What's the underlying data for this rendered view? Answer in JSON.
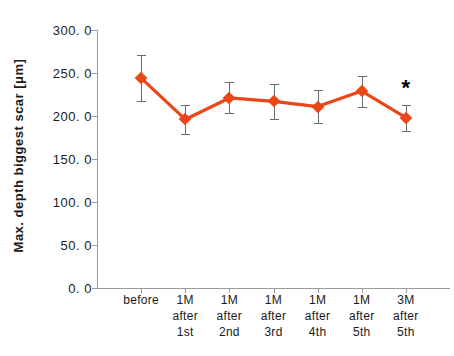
{
  "chart_data": {
    "type": "line",
    "title": "",
    "subtitle": "",
    "xlabel": "",
    "ylabel": "Max. depth biggest  scar [μm]",
    "ylim": [
      0.0,
      300.0
    ],
    "ytick_values": [
      300.0,
      250.0,
      200.0,
      150.0,
      100.0,
      50.0,
      0.0
    ],
    "ytick_labels": [
      "300. 0",
      "250. 0",
      "200. 0",
      "150. 0",
      "100. 0",
      "50. 0",
      "0. 0"
    ],
    "grid": false,
    "legend": "none",
    "categories": [
      "before",
      "1M after 1st",
      "1M after 2nd",
      "1M after 3rd",
      "1M after 4th",
      "1M after 5th",
      "3M after 5th"
    ],
    "category_lines": [
      [
        "before",
        "",
        ""
      ],
      [
        "1M",
        "after",
        "1st"
      ],
      [
        "1M",
        "after",
        "2nd"
      ],
      [
        "1M",
        "after",
        "3rd"
      ],
      [
        "1M",
        "after",
        "4th"
      ],
      [
        "1M",
        "after",
        "5th"
      ],
      [
        "3M",
        "after",
        "5th"
      ]
    ],
    "series": [
      {
        "name": "Max. depth biggest scar",
        "color": "#EA4618",
        "marker": "diamond",
        "values": [
          244.0,
          196.0,
          221.0,
          217.0,
          211.0,
          229.0,
          198.0
        ],
        "error_upper": [
          27.0,
          17.0,
          18.0,
          20.0,
          19.0,
          18.0,
          15.0
        ],
        "error_lower": [
          27.0,
          17.0,
          18.0,
          20.0,
          19.0,
          18.0,
          15.0
        ]
      }
    ],
    "annotations": [
      {
        "text": "*",
        "category": "3M after 5th",
        "value": 233.0,
        "meaning": "significance-marker"
      }
    ],
    "colors": {
      "series": "#EA4618",
      "errorbar": "#6B6B6B",
      "axis": "#9A9A9A",
      "text": "#1A1A1A",
      "background": "#FFFFFF"
    }
  }
}
